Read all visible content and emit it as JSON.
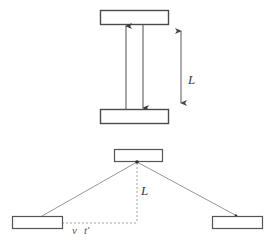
{
  "figure": {
    "background_color": "#ffffff",
    "width": 273,
    "height": 244,
    "stroke_color": "#4a4a4a",
    "faint_stroke_color": "#8a8a8a",
    "dashed_stroke_color": "#9a9a9a"
  },
  "panels": [
    {
      "id": "rest-frame",
      "name": "Rest frame light clock",
      "mirrors": [
        {
          "id": "top-mirror",
          "x": 100,
          "y": 10,
          "width": 68,
          "height": 14
        },
        {
          "id": "bottom-mirror",
          "x": 100,
          "y": 109,
          "width": 68,
          "height": 14
        }
      ],
      "beams": [
        {
          "id": "upward-beam",
          "x": 126,
          "y_from": 109,
          "y_to": 25,
          "arrow": "up"
        },
        {
          "id": "downward-beam",
          "x": 143,
          "y_from": 25,
          "y_to": 109,
          "arrow": "down"
        }
      ],
      "dimension": {
        "id": "length-dimension",
        "x": 181,
        "y_top": 24,
        "y_bottom": 109,
        "label": "L",
        "label_x": 190,
        "label_y": 84
      }
    },
    {
      "id": "moving-frame",
      "name": "Moving frame light clock",
      "mirrors": [
        {
          "id": "top-mirror-moving",
          "x": 114,
          "y": 149,
          "width": 48,
          "height": 12
        },
        {
          "id": "bottom-mirror-left",
          "x": 12,
          "y": 216,
          "width": 50,
          "height": 12
        },
        {
          "id": "bottom-mirror-right",
          "x": 212,
          "y": 216,
          "width": 50,
          "height": 12
        }
      ],
      "vertex": {
        "id": "apex-point",
        "x": 137,
        "y": 162
      },
      "slant_paths": [
        {
          "id": "left-slant",
          "x1": 42,
          "y1": 216,
          "x2": 137,
          "y2": 162
        },
        {
          "id": "right-slant",
          "x1": 137,
          "y1": 162,
          "x2": 237,
          "y2": 216
        }
      ],
      "dashed_guides": [
        {
          "id": "vertical-guide",
          "x1": 137,
          "y1": 162,
          "x2": 137,
          "y2": 223
        },
        {
          "id": "horizontal-guide",
          "x1": 42,
          "y1": 223,
          "x2": 137,
          "y2": 223
        }
      ],
      "labels": [
        {
          "id": "height-label",
          "text": "L",
          "x": 142,
          "y": 194
        },
        {
          "id": "velocity-label",
          "text": "v",
          "x": 73,
          "y": 233
        },
        {
          "id": "time-label",
          "text": "t'",
          "x": 85,
          "y": 233
        }
      ]
    }
  ]
}
